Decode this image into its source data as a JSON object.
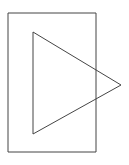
{
  "canvas": {
    "width": 129,
    "height": 165,
    "background_color": "#ffffff",
    "title": "Right-pointing triangle overlapping a rectangle"
  },
  "style": {
    "stroke_color": "#454545",
    "stroke_width": 1,
    "fill": "none"
  },
  "shapes": [
    {
      "name": "rectangle",
      "type": "rect",
      "x": 8,
      "y": 13,
      "width": 88,
      "height": 139,
      "points": "8,13 96,13 96,152 8,152",
      "stroke_color": "#454545",
      "stroke_width": 1,
      "fill": "none"
    },
    {
      "name": "triangle",
      "type": "polygon",
      "orientation": "right-pointing",
      "vertices": [
        {
          "label": "top-left",
          "x": 33,
          "y": 32
        },
        {
          "label": "apex-right",
          "x": 121,
          "y": 85
        },
        {
          "label": "bottom-left",
          "x": 33,
          "y": 134
        }
      ],
      "points": "33,32 121,85 33,134",
      "stroke_color": "#454545",
      "stroke_width": 1,
      "fill": "none"
    }
  ]
}
